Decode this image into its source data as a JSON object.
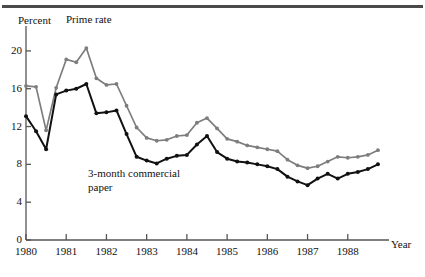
{
  "figure": {
    "percent_axis_label": "Percent",
    "year_axis_label": "Year"
  },
  "annotations": {
    "prime": "Prime rate",
    "paper_line1": "3-month commercial",
    "paper_line2": "paper"
  },
  "colors": {
    "prime_rate": "#7d7d7d",
    "commercial_paper": "#111111",
    "axis": "#555555",
    "top_rule": "#4a4a4a",
    "background": "#ffffff"
  },
  "chart_data": {
    "type": "line",
    "title": "",
    "subtitle": "",
    "xlabel": "Year",
    "ylabel": "Percent",
    "xlim": [
      1980.0,
      1989.0
    ],
    "ylim": [
      0,
      22
    ],
    "yticks": [
      0,
      4,
      8,
      12,
      16,
      20
    ],
    "xticks": [
      1980,
      1981,
      1982,
      1983,
      1984,
      1985,
      1986,
      1987,
      1988
    ],
    "xticklabels": [
      "1980",
      "1981",
      "1982",
      "1983",
      "1984",
      "1985",
      "1986",
      "1987",
      "1988"
    ],
    "grid": false,
    "legend": "inline-annotations",
    "marker": "round-dot",
    "x": [
      1980.0,
      1980.25,
      1980.5,
      1980.75,
      1981.0,
      1981.25,
      1981.5,
      1981.75,
      1982.0,
      1982.25,
      1982.5,
      1982.75,
      1983.0,
      1983.25,
      1983.5,
      1983.75,
      1984.0,
      1984.25,
      1984.5,
      1984.75,
      1985.0,
      1985.25,
      1985.5,
      1985.75,
      1986.0,
      1986.25,
      1986.5,
      1986.75,
      1987.0,
      1987.25,
      1987.5,
      1987.75,
      1988.0,
      1988.25,
      1988.5,
      1988.75
    ],
    "series": [
      {
        "name": "Prime rate",
        "color": "#7d7d7d",
        "values": [
          16.3,
          16.2,
          11.6,
          16.1,
          19.1,
          18.8,
          20.3,
          17.1,
          16.4,
          16.5,
          14.2,
          11.9,
          10.8,
          10.5,
          10.6,
          11.0,
          11.1,
          12.4,
          12.9,
          11.8,
          10.7,
          10.4,
          10.0,
          9.8,
          9.6,
          9.4,
          8.5,
          7.9,
          7.6,
          7.8,
          8.3,
          8.8,
          8.7,
          8.8,
          9.0,
          9.5
        ]
      },
      {
        "name": "3-month commercial paper",
        "color": "#111111",
        "values": [
          13.1,
          11.5,
          9.6,
          15.4,
          15.8,
          16.0,
          16.5,
          13.4,
          13.5,
          13.7,
          11.2,
          8.8,
          8.4,
          8.1,
          8.6,
          8.9,
          9.0,
          10.1,
          11.0,
          9.3,
          8.6,
          8.3,
          8.2,
          8.0,
          7.8,
          7.5,
          6.7,
          6.2,
          5.8,
          6.5,
          7.0,
          6.5,
          7.0,
          7.2,
          7.5,
          8.0
        ]
      }
    ]
  }
}
